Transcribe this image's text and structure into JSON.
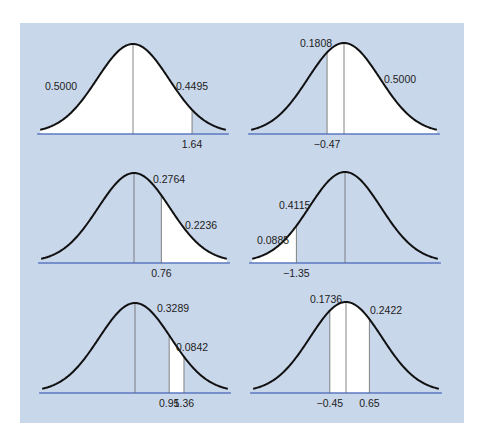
{
  "colors": {
    "background": "#ffffff",
    "panel": "#c9d7eb",
    "shaded_region": "#ffffff",
    "curve": "#111111",
    "axis": "#5b78c2",
    "divider": "#666666"
  },
  "chart_data": [
    {
      "type": "area",
      "title": "Standard normal: area between 0 and 1.64, left half",
      "distribution": "standard normal",
      "panel": "top-left",
      "shaded_from": -99,
      "shaded_to": 1.64,
      "vlines": [
        0,
        1.64
      ],
      "tick_labels": [
        {
          "z": 1.64,
          "text": "1.64"
        }
      ],
      "area_labels": [
        {
          "text": "0.5000",
          "x": 45,
          "y": 90
        },
        {
          "text": "0.4495",
          "x": 176,
          "y": 90
        }
      ],
      "center": [
        133,
        44
      ],
      "baseline": 134
    },
    {
      "type": "area",
      "title": "Standard normal: area from -0.47 to right tail",
      "distribution": "standard normal",
      "panel": "top-right",
      "shaded_from": -0.47,
      "shaded_to": 99,
      "vlines": [
        -0.47,
        0
      ],
      "tick_labels": [
        {
          "z": -0.47,
          "text": "−0.47"
        }
      ],
      "area_labels": [
        {
          "text": "0.1808",
          "x": 300,
          "y": 47
        },
        {
          "text": "0.5000",
          "x": 384,
          "y": 83
        }
      ],
      "center": [
        344,
        43
      ],
      "baseline": 134
    },
    {
      "type": "area",
      "title": "Standard normal: area above 0.76",
      "distribution": "standard normal",
      "panel": "middle-left",
      "shaded_from": 0.76,
      "shaded_to": 99,
      "vlines": [
        0,
        0.76
      ],
      "tick_labels": [
        {
          "z": 0.76,
          "text": "0.76"
        }
      ],
      "area_labels": [
        {
          "text": "0.2764",
          "x": 153,
          "y": 183
        },
        {
          "text": "0.2236",
          "x": 185,
          "y": 229
        }
      ],
      "center": [
        134,
        173
      ],
      "baseline": 263
    },
    {
      "type": "area",
      "title": "Standard normal: area below -1.35",
      "distribution": "standard normal",
      "panel": "middle-right",
      "shaded_from": -99,
      "shaded_to": -1.35,
      "vlines": [
        -1.35,
        0
      ],
      "tick_labels": [
        {
          "z": -1.35,
          "text": "−1.35"
        }
      ],
      "area_labels": [
        {
          "text": "0.4115",
          "x": 279,
          "y": 209
        },
        {
          "text": "0.0885",
          "x": 257,
          "y": 244
        }
      ],
      "center": [
        345,
        172
      ],
      "baseline": 263
    },
    {
      "type": "area",
      "title": "Standard normal: area between 0.95 and 1.36",
      "distribution": "standard normal",
      "panel": "bottom-left",
      "shaded_from": 0.95,
      "shaded_to": 1.36,
      "vlines": [
        0,
        0.95,
        1.36
      ],
      "tick_labels": [
        {
          "z": 0.95,
          "text": "0.95"
        },
        {
          "z": 1.36,
          "text": "1.36"
        }
      ],
      "area_labels": [
        {
          "text": "0.3289",
          "x": 157,
          "y": 312
        },
        {
          "text": "0.0842",
          "x": 176,
          "y": 351
        }
      ],
      "center": [
        135,
        303
      ],
      "baseline": 393
    },
    {
      "type": "area",
      "title": "Standard normal: area between -0.45 and 0.65",
      "distribution": "standard normal",
      "panel": "bottom-right",
      "shaded_from": -0.45,
      "shaded_to": 0.65,
      "vlines": [
        -0.45,
        0,
        0.65
      ],
      "tick_labels": [
        {
          "z": -0.45,
          "text": "−0.45"
        },
        {
          "z": 0.65,
          "text": "0.65"
        }
      ],
      "area_labels": [
        {
          "text": "0.1736",
          "x": 310,
          "y": 303
        },
        {
          "text": "0.2422",
          "x": 370,
          "y": 314
        }
      ],
      "center": [
        346,
        302
      ],
      "baseline": 393
    }
  ]
}
